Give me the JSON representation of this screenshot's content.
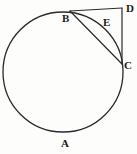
{
  "figure": {
    "background_color": "#fdfdfc",
    "stroke_color": "#2b2b2b",
    "label_color": "#1b1b1b"
  },
  "circle": {
    "center_x": 63,
    "center_y": 72,
    "radius": 60,
    "stroke_width": 1.3
  },
  "points": [
    {
      "id": "A",
      "label": "A",
      "role": "arc-label-bottom",
      "x": 64,
      "y": 133,
      "label_x": 61,
      "label_y": 138
    },
    {
      "id": "B",
      "label": "B",
      "role": "point-on-circle",
      "x": 70,
      "y": 11,
      "label_x": 62,
      "label_y": 13
    },
    {
      "id": "C",
      "label": "C",
      "role": "point-on-circle",
      "x": 122,
      "y": 64,
      "label_x": 124,
      "label_y": 60
    },
    {
      "id": "D",
      "label": "D",
      "role": "external-point",
      "x": 122,
      "y": 8,
      "label_x": 126,
      "label_y": 3
    },
    {
      "id": "E",
      "label": "E",
      "role": "arc-label-minor",
      "x": 104,
      "y": 28,
      "label_x": 103,
      "label_y": 17
    }
  ],
  "segments": [
    {
      "id": "BD",
      "from": "B",
      "to": "D",
      "type": "tangent-top",
      "x1": 70,
      "y1": 11,
      "x2": 122,
      "y2": 8
    },
    {
      "id": "DC",
      "from": "D",
      "to": "C",
      "type": "tangent-right",
      "x1": 122,
      "y1": 8,
      "x2": 122,
      "y2": 64
    },
    {
      "id": "BC",
      "from": "B",
      "to": "C",
      "type": "chord",
      "x1": 70,
      "y1": 11,
      "x2": 122,
      "y2": 64
    }
  ],
  "arcs": [
    {
      "id": "BEC",
      "from": "B",
      "to": "C",
      "label": "E",
      "description": "minor arc from B to C passing near E"
    }
  ]
}
